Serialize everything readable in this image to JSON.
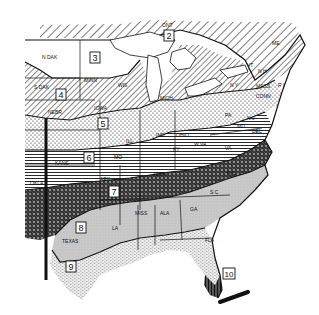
{
  "map": {
    "type": "plant hardiness zone map (eastern United States)",
    "colors": {
      "ink": "#111111",
      "paper": "#ffffff",
      "zone9_fill": "#e8e8e8",
      "zone8_fill": "#c9c9c9"
    },
    "zones": [
      {
        "number": "2",
        "pattern": "diagonal-hatch-wide"
      },
      {
        "number": "3",
        "pattern": "blank"
      },
      {
        "number": "4",
        "pattern": "diagonal-hatch"
      },
      {
        "number": "5",
        "pattern": "dots"
      },
      {
        "number": "6",
        "pattern": "horizontal-lines"
      },
      {
        "number": "7",
        "pattern": "crosshatch-dark"
      },
      {
        "number": "8",
        "pattern": "light-gray"
      },
      {
        "number": "9",
        "pattern": "fine-stipple"
      },
      {
        "number": "10",
        "pattern": "vertical-lines-dark"
      }
    ],
    "zone_labels": {
      "z2": "2",
      "z3": "3",
      "z4": "4",
      "z5": "5",
      "z6": "6",
      "z7": "7",
      "z8": "8",
      "z9": "9",
      "z10": "10"
    },
    "state_labels": {
      "ndak": "N DAK",
      "sdak": "S DAK",
      "nebr": "NEBR",
      "kans": "KANS",
      "okla": "OKLA",
      "texas": "TEXAS",
      "minn": "MINN",
      "iowa": "IOWA",
      "mo": "MO",
      "ark": "ARK",
      "la": "LA",
      "wis": "WIS",
      "mich": "MICH",
      "ill": "ILL",
      "ind": "IND",
      "ohio": "OHIO",
      "ky": "KY",
      "tenn": "TENN",
      "miss": "MISS",
      "ala": "ALA",
      "ga": "GA",
      "fla": "FLA",
      "sc": "S C",
      "nc": "N C",
      "va": "VA",
      "wva": "W VA",
      "pa": "PA",
      "ny": "N Y",
      "nj": "N J",
      "del": "DEL",
      "md": "MD",
      "conn": "CONN",
      "mass": "MASS",
      "ri": "R I",
      "nh": "N H",
      "vt": "VT",
      "me": "ME",
      "ont": "ONT"
    }
  }
}
